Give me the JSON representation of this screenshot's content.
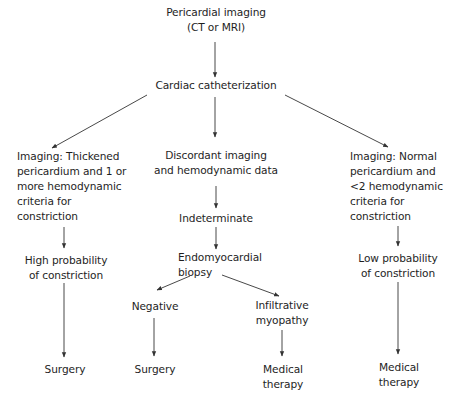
{
  "diagram": {
    "type": "flowchart",
    "nodes": {
      "root": {
        "lines": [
          "Pericardial imaging",
          "(CT or MRI)"
        ]
      },
      "cath": {
        "lines": [
          "Cardiac catheterization"
        ]
      },
      "left_imaging": {
        "lines": [
          "Imaging: Thickened",
          "pericardium and 1 or",
          "more hemodynamic",
          "criteria for",
          "constriction"
        ]
      },
      "mid_discordant": {
        "lines": [
          "Discordant imaging",
          "and hemodynamic data"
        ]
      },
      "right_imaging": {
        "lines": [
          "Imaging: Normal",
          "pericardium and",
          "<2 hemodynamic",
          "criteria for",
          "constriction"
        ]
      },
      "high_prob": {
        "lines": [
          "High probability",
          "of constriction"
        ]
      },
      "indeterminate": {
        "lines": [
          "Indeterminate"
        ]
      },
      "low_prob": {
        "lines": [
          "Low probability",
          "of constriction"
        ]
      },
      "biopsy": {
        "lines": [
          "Endomyocardial",
          "biopsy"
        ]
      },
      "negative": {
        "lines": [
          "Negative"
        ]
      },
      "infiltrative": {
        "lines": [
          "Infiltrative",
          "myopathy"
        ]
      },
      "surgery_left": {
        "lines": [
          "Surgery"
        ]
      },
      "surgery_mid": {
        "lines": [
          "Surgery"
        ]
      },
      "medical_mid": {
        "lines": [
          "Medical",
          "therapy"
        ]
      },
      "medical_right": {
        "lines": [
          "Medical",
          "therapy"
        ]
      }
    },
    "edges": [
      [
        "root",
        "cath"
      ],
      [
        "cath",
        "left_imaging"
      ],
      [
        "cath",
        "mid_discordant"
      ],
      [
        "cath",
        "right_imaging"
      ],
      [
        "left_imaging",
        "high_prob"
      ],
      [
        "high_prob",
        "surgery_left"
      ],
      [
        "mid_discordant",
        "indeterminate"
      ],
      [
        "indeterminate",
        "biopsy"
      ],
      [
        "biopsy",
        "negative"
      ],
      [
        "biopsy",
        "infiltrative"
      ],
      [
        "negative",
        "surgery_mid"
      ],
      [
        "infiltrative",
        "medical_mid"
      ],
      [
        "right_imaging",
        "low_prob"
      ],
      [
        "low_prob",
        "medical_right"
      ]
    ],
    "colors": {
      "text": "#1e1e1e",
      "line": "#333333",
      "background": "#ffffff"
    }
  }
}
